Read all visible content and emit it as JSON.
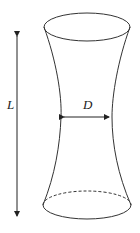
{
  "figure": {
    "labels": {
      "length": "L",
      "diameter": "D"
    },
    "colors": {
      "stroke": "#333333",
      "background": "#ffffff"
    }
  }
}
